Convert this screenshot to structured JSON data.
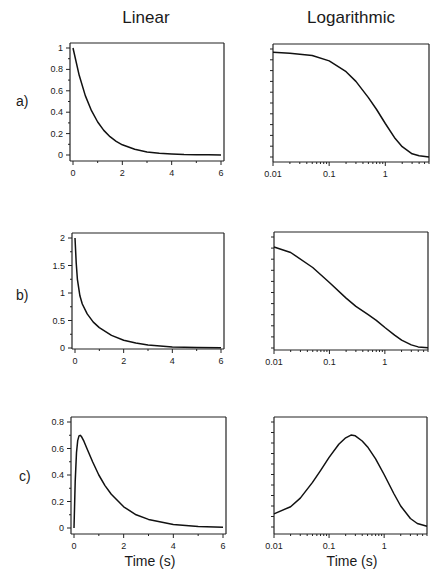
{
  "column_titles": [
    "Linear",
    "Logarithmic"
  ],
  "row_labels": [
    "a)",
    "b)",
    "c)"
  ],
  "xlabel": "Time (s)",
  "chart_data": [
    {
      "type": "line",
      "row": "a)",
      "scale": "linear",
      "title": "Linear",
      "xlabel": "",
      "ylabel": "",
      "xlim": [
        0,
        6
      ],
      "ylim": [
        0,
        1
      ],
      "xticks": [
        "0",
        "2",
        "4",
        "6"
      ],
      "yticks": [
        "0",
        "0.2",
        "0.4",
        "0.6",
        "0.8",
        "1"
      ],
      "x": [
        0,
        0.25,
        0.5,
        0.75,
        1,
        1.25,
        1.5,
        1.75,
        2,
        2.5,
        3,
        3.5,
        4,
        4.5,
        5,
        5.5,
        6
      ],
      "y": [
        1,
        0.745,
        0.555,
        0.414,
        0.308,
        0.23,
        0.171,
        0.128,
        0.095,
        0.053,
        0.029,
        0.016,
        0.009,
        0.005,
        0.003,
        0.002,
        0.001
      ]
    },
    {
      "type": "line",
      "row": "a)",
      "scale": "log",
      "title": "Logarithmic",
      "xlabel": "",
      "ylabel": "",
      "xlim": [
        0.01,
        6
      ],
      "ylim": [
        0,
        1
      ],
      "xticks": [
        "0.01",
        "0.1",
        "1"
      ],
      "yticks": [],
      "x": [
        0.01,
        0.02,
        0.05,
        0.1,
        0.2,
        0.3,
        0.5,
        0.7,
        1,
        1.5,
        2,
        3,
        4,
        6
      ],
      "y": [
        0.97,
        0.96,
        0.94,
        0.89,
        0.79,
        0.7,
        0.55,
        0.44,
        0.31,
        0.17,
        0.095,
        0.03,
        0.012,
        0.001
      ]
    },
    {
      "type": "line",
      "row": "b)",
      "scale": "linear",
      "title": "",
      "xlabel": "",
      "ylabel": "",
      "xlim": [
        0,
        6
      ],
      "ylim": [
        0,
        2
      ],
      "xticks": [
        "0",
        "2",
        "4",
        "6"
      ],
      "yticks": [
        "0",
        "0.5",
        "1",
        "1.5",
        "2"
      ],
      "x": [
        0,
        0.05,
        0.1,
        0.2,
        0.3,
        0.5,
        0.75,
        1,
        1.5,
        2,
        2.5,
        3,
        4,
        5,
        6
      ],
      "y": [
        2,
        1.55,
        1.25,
        0.95,
        0.8,
        0.62,
        0.47,
        0.37,
        0.23,
        0.14,
        0.09,
        0.055,
        0.02,
        0.008,
        0.003
      ]
    },
    {
      "type": "line",
      "row": "b)",
      "scale": "log",
      "title": "",
      "xlabel": "",
      "ylabel": "",
      "xlim": [
        0.01,
        6
      ],
      "ylim": [
        0,
        2
      ],
      "xticks": [
        "0.01",
        "0.1",
        "1"
      ],
      "yticks": [],
      "x": [
        0.01,
        0.02,
        0.05,
        0.1,
        0.2,
        0.3,
        0.5,
        0.7,
        1,
        1.5,
        2,
        3,
        4,
        6
      ],
      "y": [
        1.82,
        1.72,
        1.45,
        1.18,
        0.9,
        0.75,
        0.6,
        0.5,
        0.37,
        0.23,
        0.14,
        0.055,
        0.02,
        0.003
      ]
    },
    {
      "type": "line",
      "row": "c)",
      "scale": "linear",
      "title": "",
      "xlabel": "Time (s)",
      "ylabel": "",
      "xlim": [
        0,
        6
      ],
      "ylim": [
        0,
        0.8
      ],
      "xticks": [
        "0",
        "2",
        "4",
        "6"
      ],
      "yticks": [
        "0",
        "0.2",
        "0.4",
        "0.6",
        "0.8"
      ],
      "x": [
        0,
        0.05,
        0.1,
        0.15,
        0.2,
        0.25,
        0.3,
        0.4,
        0.5,
        0.75,
        1,
        1.25,
        1.5,
        2,
        2.5,
        3,
        4,
        5,
        6
      ],
      "y": [
        0,
        0.35,
        0.57,
        0.66,
        0.695,
        0.7,
        0.69,
        0.655,
        0.61,
        0.5,
        0.4,
        0.32,
        0.255,
        0.16,
        0.1,
        0.065,
        0.027,
        0.012,
        0.006
      ]
    },
    {
      "type": "line",
      "row": "c)",
      "scale": "log",
      "title": "",
      "xlabel": "Time (s)",
      "ylabel": "",
      "xlim": [
        0.01,
        6
      ],
      "ylim": [
        0,
        0.8
      ],
      "xticks": [
        "0.01",
        "0.1",
        "1"
      ],
      "yticks": [],
      "x": [
        0.01,
        0.02,
        0.03,
        0.05,
        0.07,
        0.1,
        0.15,
        0.2,
        0.25,
        0.3,
        0.4,
        0.5,
        0.7,
        1,
        1.5,
        2,
        3,
        4,
        6
      ],
      "y": [
        0.1,
        0.155,
        0.22,
        0.34,
        0.43,
        0.53,
        0.63,
        0.68,
        0.7,
        0.695,
        0.655,
        0.61,
        0.52,
        0.4,
        0.255,
        0.16,
        0.065,
        0.027,
        0.006
      ]
    }
  ]
}
